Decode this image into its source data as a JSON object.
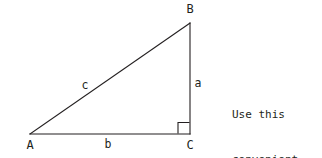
{
  "diagram": {
    "type": "right-triangle",
    "stroke_color": "#231f20",
    "background_color": "#ffffff",
    "vertices": [
      {
        "name": "A",
        "label": "A",
        "x": 30,
        "y": 134
      },
      {
        "name": "B",
        "label": "B",
        "x": 190,
        "y": 23
      },
      {
        "name": "C",
        "label": "C",
        "x": 190,
        "y": 134
      }
    ],
    "sides": [
      {
        "name": "a",
        "label": "a",
        "from": "B",
        "to": "C",
        "description": "vertical leg opposite vertex A"
      },
      {
        "name": "b",
        "label": "b",
        "from": "A",
        "to": "C",
        "description": "horizontal leg opposite vertex B"
      },
      {
        "name": "c",
        "label": "c",
        "from": "A",
        "to": "B",
        "description": "hypotenuse opposite vertex C"
      }
    ],
    "right_angle": {
      "at_vertex": "C",
      "marker": "square",
      "size": 11
    }
  },
  "note": {
    "lines": [
      "Use this",
      "convenient",
      "notation."
    ],
    "line1": "Use this",
    "line2": "convenient",
    "line3": "notation."
  }
}
